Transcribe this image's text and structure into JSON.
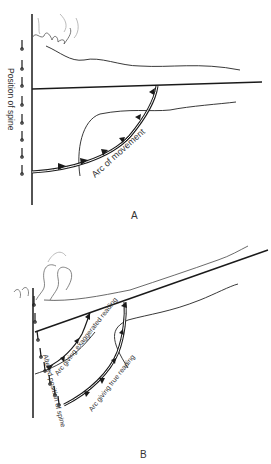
{
  "figure": {
    "panel_a": {
      "label": "A",
      "axis_label": "Position of spine",
      "arc_label": "Arc of movement"
    },
    "panel_b": {
      "label": "B",
      "axis_label": "Altered position of spine",
      "arc_exaggerated_label": "Arc giving exaggerated reading",
      "arc_true_label": "Arc giving true reading"
    }
  },
  "colors": {
    "ink": "#1a1a1a",
    "light_ink": "#888888",
    "background": "#ffffff"
  }
}
